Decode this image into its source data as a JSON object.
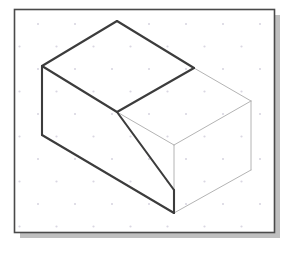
{
  "figure": {
    "type": "isometric-line-drawing",
    "canvas": {
      "width": 287,
      "height": 253,
      "background": "#ffffff"
    },
    "frame": {
      "name": "drawing-border",
      "x": 14,
      "y": 9,
      "width": 260,
      "height": 223,
      "stroke": "#4a4a4a",
      "stroke_width": 1.6,
      "fill": "#ffffff",
      "shadow": {
        "name": "drop-shadow",
        "offset_x": 6,
        "offset_y": 6,
        "color": "#bfbfbf"
      }
    },
    "grid": {
      "name": "isometric-dot-grid",
      "dot_color": "#d9d6e2",
      "dot_radius": 1.1,
      "spacing_x": 37,
      "spacing_y": 22.5,
      "origin_x": 38,
      "origin_y": 24,
      "stagger_x": 18.5,
      "columns": 7,
      "rows": 10
    },
    "vertices": {
      "top_apex": [
        117,
        21
      ],
      "top_left": [
        42,
        66
      ],
      "top_right": [
        194,
        68
      ],
      "center": [
        117,
        112
      ],
      "left_bottom": [
        42,
        135
      ],
      "slope_bottom": [
        174,
        190
      ],
      "bottom_front": [
        174,
        213
      ],
      "far_right_top": [
        251,
        101
      ],
      "far_right_bottom": [
        251,
        170
      ]
    },
    "strokes": {
      "visible_color": "#3c3c3c",
      "visible_width": 2.1,
      "far_color": "#b4b4b4",
      "far_width": 1.0
    },
    "edges": [
      {
        "name": "edge-top-left-rise",
        "weight": "visible",
        "points": "42,66 117,21"
      },
      {
        "name": "edge-top-right-fall",
        "weight": "visible",
        "points": "117,21 194,68"
      },
      {
        "name": "edge-top-face-left-diagonal",
        "weight": "visible",
        "points": "42,66 117,112"
      },
      {
        "name": "edge-top-face-right-diagonal",
        "weight": "visible",
        "points": "194,68 117,112"
      },
      {
        "name": "edge-left-vertical",
        "weight": "visible",
        "points": "42,66 42,135"
      },
      {
        "name": "edge-left-bottom-diagonal",
        "weight": "visible",
        "points": "42,135 174,213"
      },
      {
        "name": "edge-inclined-face-slope",
        "weight": "visible",
        "points": "117,112 174,190"
      },
      {
        "name": "edge-front-short-vertical",
        "weight": "visible",
        "points": "174,190 174,213"
      },
      {
        "name": "edge-right-top-back",
        "weight": "far",
        "points": "194,68 251,101"
      },
      {
        "name": "edge-right-top-front",
        "weight": "far",
        "points": "117,112 174,145"
      },
      {
        "name": "edge-right-upper-ridge",
        "weight": "far",
        "points": "174,145 251,101"
      },
      {
        "name": "edge-far-right-vertical",
        "weight": "far",
        "points": "251,101 251,170"
      },
      {
        "name": "edge-right-lower-diagonal",
        "weight": "far",
        "points": "174,213 251,170"
      },
      {
        "name": "edge-right-front-vertical",
        "weight": "far",
        "points": "174,145 174,213"
      }
    ]
  }
}
